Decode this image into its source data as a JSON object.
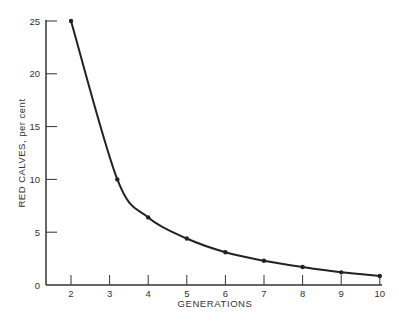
{
  "chart_data": {
    "type": "line",
    "title": "",
    "xlabel": "GENERATIONS",
    "ylabel": "RED CALVES, per cent",
    "x_ticks": [
      "2",
      "3",
      "4",
      "5",
      "6",
      "7",
      "8",
      "9",
      "10"
    ],
    "y_ticks": [
      "0",
      "5",
      "10",
      "15",
      "20",
      "25"
    ],
    "xlim": [
      1.35,
      10
    ],
    "ylim": [
      0,
      25
    ],
    "grid": false,
    "legend": null,
    "series": [
      {
        "name": "Red calves",
        "x": [
          2,
          3.2,
          4,
          5,
          6,
          7,
          8,
          9,
          10
        ],
        "values": [
          25,
          10,
          6.4,
          4.4,
          3.1,
          2.3,
          1.7,
          1.2,
          0.85
        ],
        "markers": true,
        "smooth": true
      }
    ]
  },
  "colors": {
    "line": "#222222",
    "axis": "#333333",
    "text": "#333333",
    "background": "#ffffff"
  }
}
